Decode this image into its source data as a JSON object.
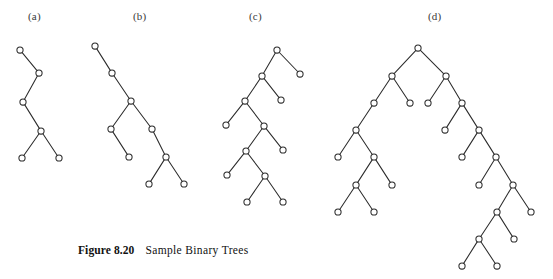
{
  "figure": {
    "caption_label": "Figure 8.20",
    "caption_text": "Sample Binary Trees",
    "background_color": "#ffffff",
    "ink_color": "#2b2b2b",
    "node_radius": 3.1,
    "panels": [
      {
        "id": "a",
        "label": "(a)",
        "label_x": 28,
        "label_y": 10,
        "node_count": 6,
        "nodes": [
          {
            "id": "a0",
            "x": 20,
            "y": 50
          },
          {
            "id": "a1",
            "x": 39,
            "y": 73
          },
          {
            "id": "a2",
            "x": 23,
            "y": 102
          },
          {
            "id": "a3",
            "x": 41,
            "y": 131
          },
          {
            "id": "a4",
            "x": 22,
            "y": 158
          },
          {
            "id": "a5",
            "x": 59,
            "y": 158
          }
        ],
        "edges": [
          [
            "a0",
            "a1"
          ],
          [
            "a1",
            "a2"
          ],
          [
            "a2",
            "a3"
          ],
          [
            "a3",
            "a4"
          ],
          [
            "a3",
            "a5"
          ]
        ]
      },
      {
        "id": "b",
        "label": "(b)",
        "label_x": 133,
        "label_y": 10,
        "node_count": 9,
        "nodes": [
          {
            "id": "b0",
            "x": 95,
            "y": 46
          },
          {
            "id": "b1",
            "x": 112,
            "y": 73
          },
          {
            "id": "b2",
            "x": 131,
            "y": 101
          },
          {
            "id": "b3",
            "x": 111,
            "y": 129
          },
          {
            "id": "b4",
            "x": 129,
            "y": 157
          },
          {
            "id": "b5",
            "x": 152,
            "y": 129
          },
          {
            "id": "b6",
            "x": 166,
            "y": 157
          },
          {
            "id": "b7",
            "x": 149,
            "y": 184
          },
          {
            "id": "b8",
            "x": 184,
            "y": 184
          }
        ],
        "edges": [
          [
            "b0",
            "b1"
          ],
          [
            "b1",
            "b2"
          ],
          [
            "b2",
            "b3"
          ],
          [
            "b3",
            "b4"
          ],
          [
            "b2",
            "b5"
          ],
          [
            "b5",
            "b6"
          ],
          [
            "b6",
            "b7"
          ],
          [
            "b6",
            "b8"
          ]
        ]
      },
      {
        "id": "c",
        "label": "(c)",
        "label_x": 249,
        "label_y": 10,
        "node_count": 11,
        "nodes": [
          {
            "id": "c0",
            "x": 277,
            "y": 50
          },
          {
            "id": "c1",
            "x": 300,
            "y": 74
          },
          {
            "id": "c2",
            "x": 262,
            "y": 76
          },
          {
            "id": "c3",
            "x": 281,
            "y": 100
          },
          {
            "id": "c4",
            "x": 245,
            "y": 101
          },
          {
            "id": "c5",
            "x": 226,
            "y": 125
          },
          {
            "id": "c6",
            "x": 264,
            "y": 126
          },
          {
            "id": "c7",
            "x": 283,
            "y": 150
          },
          {
            "id": "c8",
            "x": 246,
            "y": 151
          },
          {
            "id": "c9",
            "x": 227,
            "y": 175
          },
          {
            "id": "c10",
            "x": 265,
            "y": 176
          },
          {
            "id": "c11",
            "x": 247,
            "y": 202
          },
          {
            "id": "c12",
            "x": 283,
            "y": 202
          }
        ],
        "edges": [
          [
            "c0",
            "c1"
          ],
          [
            "c0",
            "c2"
          ],
          [
            "c2",
            "c3"
          ],
          [
            "c2",
            "c4"
          ],
          [
            "c4",
            "c5"
          ],
          [
            "c4",
            "c6"
          ],
          [
            "c6",
            "c7"
          ],
          [
            "c6",
            "c8"
          ],
          [
            "c8",
            "c9"
          ],
          [
            "c8",
            "c10"
          ],
          [
            "c10",
            "c11"
          ],
          [
            "c10",
            "c12"
          ]
        ]
      },
      {
        "id": "d",
        "label": "(d)",
        "label_x": 428,
        "label_y": 10,
        "node_count": 27,
        "nodes": [
          {
            "id": "d0",
            "x": 418,
            "y": 48
          },
          {
            "id": "d1",
            "x": 392,
            "y": 76
          },
          {
            "id": "d2",
            "x": 446,
            "y": 76
          },
          {
            "id": "d3",
            "x": 374,
            "y": 103
          },
          {
            "id": "d4",
            "x": 410,
            "y": 103
          },
          {
            "id": "d5",
            "x": 428,
            "y": 103
          },
          {
            "id": "d6",
            "x": 462,
            "y": 103
          },
          {
            "id": "d7",
            "x": 356,
            "y": 130
          },
          {
            "id": "d8",
            "x": 338,
            "y": 157
          },
          {
            "id": "d9",
            "x": 374,
            "y": 157
          },
          {
            "id": "d10",
            "x": 356,
            "y": 185
          },
          {
            "id": "d11",
            "x": 392,
            "y": 185
          },
          {
            "id": "d12",
            "x": 338,
            "y": 212
          },
          {
            "id": "d13",
            "x": 374,
            "y": 212
          },
          {
            "id": "d14",
            "x": 445,
            "y": 130
          },
          {
            "id": "d15",
            "x": 479,
            "y": 130
          },
          {
            "id": "d16",
            "x": 462,
            "y": 157
          },
          {
            "id": "d17",
            "x": 496,
            "y": 157
          },
          {
            "id": "d18",
            "x": 479,
            "y": 185
          },
          {
            "id": "d19",
            "x": 513,
            "y": 185
          },
          {
            "id": "d20",
            "x": 531,
            "y": 212
          },
          {
            "id": "d21",
            "x": 497,
            "y": 212
          },
          {
            "id": "d22",
            "x": 514,
            "y": 239
          },
          {
            "id": "d23",
            "x": 479,
            "y": 239
          },
          {
            "id": "d24",
            "x": 462,
            "y": 266
          },
          {
            "id": "d25",
            "x": 497,
            "y": 266
          }
        ],
        "edges": [
          [
            "d0",
            "d1"
          ],
          [
            "d0",
            "d2"
          ],
          [
            "d1",
            "d3"
          ],
          [
            "d1",
            "d4"
          ],
          [
            "d2",
            "d5"
          ],
          [
            "d2",
            "d6"
          ],
          [
            "d3",
            "d7"
          ],
          [
            "d7",
            "d8"
          ],
          [
            "d7",
            "d9"
          ],
          [
            "d9",
            "d10"
          ],
          [
            "d9",
            "d11"
          ],
          [
            "d10",
            "d12"
          ],
          [
            "d10",
            "d13"
          ],
          [
            "d6",
            "d14"
          ],
          [
            "d6",
            "d15"
          ],
          [
            "d15",
            "d16"
          ],
          [
            "d15",
            "d17"
          ],
          [
            "d17",
            "d18"
          ],
          [
            "d17",
            "d19"
          ],
          [
            "d19",
            "d20"
          ],
          [
            "d19",
            "d21"
          ],
          [
            "d21",
            "d22"
          ],
          [
            "d21",
            "d23"
          ],
          [
            "d23",
            "d24"
          ],
          [
            "d23",
            "d25"
          ]
        ]
      }
    ]
  }
}
